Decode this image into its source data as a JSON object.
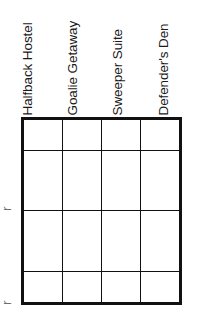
{
  "table": {
    "column_headers": [
      {
        "label": "Halfback Hostel",
        "clipped": "top"
      },
      {
        "label": "Goalie Getaway",
        "clipped": "top"
      },
      {
        "label": "Sweeper Suite",
        "clipped": "none"
      },
      {
        "label": "Defender's Den",
        "clipped": "top-right"
      }
    ],
    "row_labels": [
      {
        "label": ""
      },
      {
        "label": "r"
      },
      {
        "label": ""
      },
      {
        "label": "r"
      }
    ],
    "rows": [
      {
        "cells": [
          "",
          "",
          "",
          ""
        ]
      },
      {
        "cells": [
          "",
          "",
          "",
          ""
        ]
      },
      {
        "cells": [
          "",
          "",
          "",
          ""
        ]
      },
      {
        "cells": [
          "",
          "",
          "",
          ""
        ]
      }
    ],
    "column_count": 4,
    "row_count": 4,
    "border_color": "#111111",
    "background_color": "#ffffff",
    "text_color": "#1a1a1a"
  }
}
